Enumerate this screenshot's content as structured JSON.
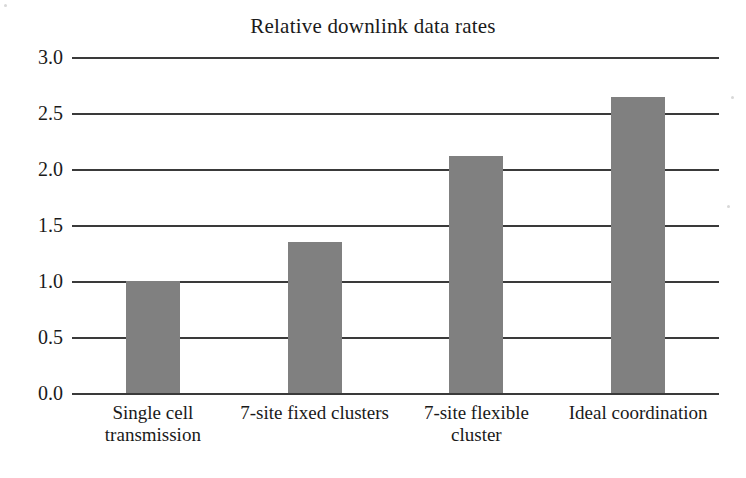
{
  "chart_data": {
    "type": "bar",
    "title": "Relative downlink data rates",
    "xlabel": "",
    "ylabel": "",
    "categories": [
      "Single cell transmission",
      "7-site fixed clusters",
      "7-site flexible cluster",
      "Ideal coordination"
    ],
    "values": [
      1.0,
      1.35,
      2.12,
      2.64
    ],
    "ylim": [
      0.0,
      3.0
    ],
    "ytick_labels": [
      "0.0",
      "0.5",
      "1.0",
      "1.5",
      "2.0",
      "2.5",
      "3.0"
    ],
    "ytick_values": [
      0.0,
      0.5,
      1.0,
      1.5,
      2.0,
      2.5,
      3.0
    ],
    "grid": true,
    "legend": false,
    "bar_color": "#808080",
    "axis_color": "#3a3a3a",
    "background_color": "#ffffff"
  }
}
